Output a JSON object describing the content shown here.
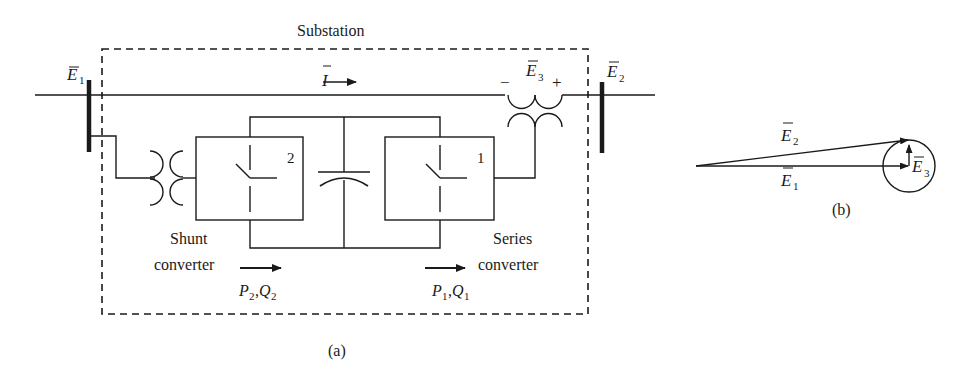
{
  "figure_a": {
    "title": "Substation",
    "caption": "(a)",
    "bus_left": {
      "symbol": "E",
      "subscript": "1",
      "overbar": true
    },
    "bus_right": {
      "symbol": "E",
      "subscript": "2",
      "overbar": true
    },
    "current": {
      "symbol": "I",
      "overbar": true,
      "arrow": "right"
    },
    "series_injection": {
      "symbol": "E",
      "subscript": "3",
      "overbar": true,
      "minus": "−",
      "plus": "+"
    },
    "converter_shunt": {
      "number": "2",
      "label_line1": "Shunt",
      "label_line2": "converter",
      "flow": {
        "p": "P",
        "p_sub": "2",
        "sep": ",",
        "q": "Q",
        "q_sub": "2"
      }
    },
    "converter_series": {
      "number": "1",
      "label_line1": "Series",
      "label_line2": "converter",
      "flow": {
        "p": "P",
        "p_sub": "1",
        "sep": ",",
        "q": "Q",
        "q_sub": "1"
      }
    }
  },
  "figure_b": {
    "caption": "(b)",
    "phasor_e2": {
      "symbol": "E",
      "subscript": "2",
      "overbar": true
    },
    "phasor_e1": {
      "symbol": "E",
      "subscript": "1",
      "overbar": true
    },
    "phasor_e3": {
      "symbol": "E",
      "subscript": "3",
      "overbar": true
    }
  },
  "colors": {
    "ink": "#1a1a1a",
    "background": "#ffffff"
  }
}
